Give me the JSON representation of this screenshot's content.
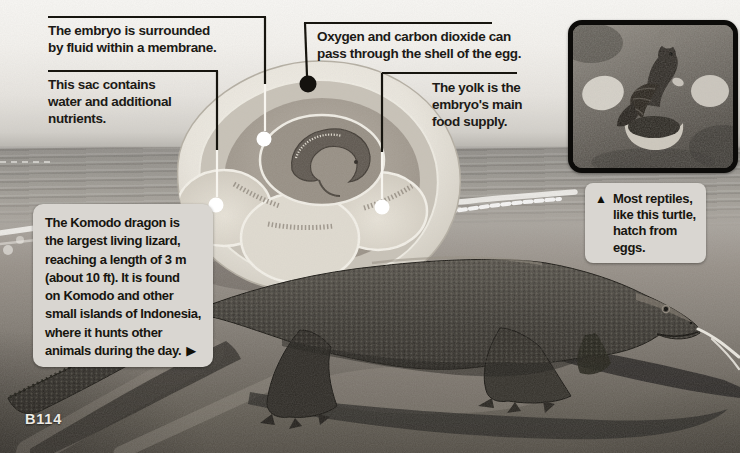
{
  "page": {
    "number": "B114"
  },
  "colors": {
    "callout_line": "#17150f",
    "callout_line_on_egg": "#f7f5ef",
    "dot_white": "#ffffff",
    "dot_black": "#14120e",
    "caption_box_bg": "#d9d6d1",
    "text": "#17150f"
  },
  "egg_diagram": {
    "callouts": [
      {
        "id": "embryo",
        "text": "The embryo is surrounded\nby fluid within a membrane."
      },
      {
        "id": "sac",
        "text": "This sac contains\nwater and additional\nnutrients."
      },
      {
        "id": "shell",
        "text": "Oxygen and carbon dioxide can\npass through the shell of the egg."
      },
      {
        "id": "yolk",
        "text": "The yolk is the\nembryo's main\nfood supply."
      }
    ]
  },
  "komodo_caption": {
    "text": "The Komodo dragon is\nthe largest living lizard,\nreaching a length of 3 m\n(about 10 ft). It is found\non Komodo and other\nsmall islands of Indonesia,\nwhere it hunts other\nanimals during the day.",
    "marker": "▶"
  },
  "turtle_caption": {
    "marker": "▲",
    "text": "Most reptiles,\nlike this turtle,\nhatch from\neggs."
  }
}
